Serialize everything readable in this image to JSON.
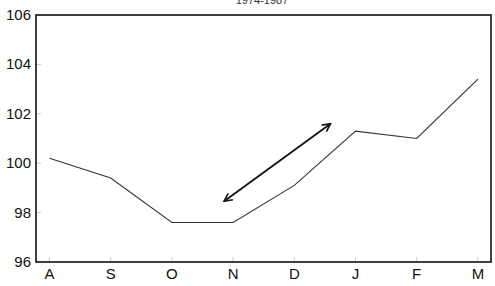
{
  "chart_data": {
    "type": "line",
    "title": "1974-1987",
    "xlabel": "",
    "ylabel": "",
    "categories": [
      "A",
      "S",
      "O",
      "N",
      "D",
      "J",
      "F",
      "M"
    ],
    "series": [
      {
        "name": "series",
        "values": [
          100.2,
          99.4,
          97.6,
          97.6,
          99.1,
          101.3,
          101.0,
          103.4
        ]
      }
    ],
    "ylim": [
      96,
      106
    ],
    "yticks": [
      96,
      98,
      100,
      102,
      104,
      106
    ],
    "grid": false,
    "legend": null,
    "annotations": [
      {
        "type": "double-arrow",
        "from": {
          "x": "N",
          "y": 98.5
        },
        "to": {
          "x": "J",
          "y": 101.6
        }
      }
    ]
  },
  "colors": {
    "line": "#333333",
    "axis": "#111111",
    "arrow": "#111111"
  }
}
